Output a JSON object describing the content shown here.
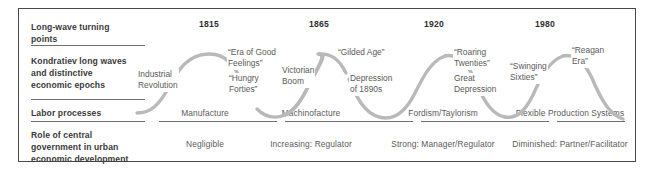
{
  "figure": {
    "rows": [
      {
        "label": "Long-wave turning\npoints"
      },
      {
        "label": "Kondratiev long waves\nand distinctive\neconomic epochs"
      },
      {
        "label": "Labor processes"
      },
      {
        "label": "Role of central\ngovernment in urban\neconomic development"
      }
    ],
    "turning_points": [
      "1815",
      "1865",
      "1920",
      "1980"
    ],
    "epochs": [
      {
        "text": "Industrial\nRevolution"
      },
      {
        "text": "“Era of Good\nFeelings”"
      },
      {
        "text": "“Hungry\nForties”"
      },
      {
        "text": "Victorian\nBoom"
      },
      {
        "text": "“Gilded Age”"
      },
      {
        "text": "Depression\nof 1890s"
      },
      {
        "text": "“Roaring\nTwenties”"
      },
      {
        "text": "Great\nDepression"
      },
      {
        "text": "“Swinging\nSixties”"
      },
      {
        "text": "“Reagan\nEra”"
      }
    ],
    "labor_processes": [
      "Manufacture",
      "Machinofacture",
      "Fordism/Taylorism",
      "Flexible Production Systems"
    ],
    "government_roles": [
      "Negligible",
      "Increasing: Regulator",
      "Strong: Manager/Regulator",
      "Diminished: Partner/Facilitator"
    ],
    "colors": {
      "border": "#4a4a4a",
      "rule": "#6e6e6e",
      "wave": "#b9b9b9",
      "label_text": "#3a3a3a",
      "body_text": "#5a5a5a"
    }
  }
}
